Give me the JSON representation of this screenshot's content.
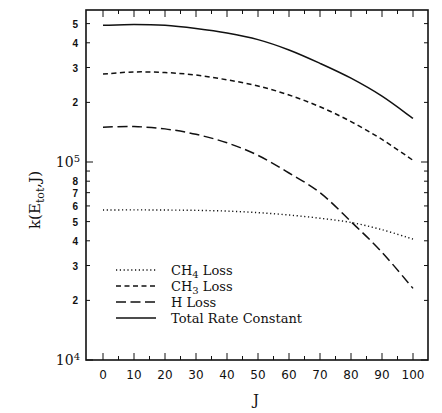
{
  "chart_data": {
    "type": "line",
    "title": "",
    "xlabel": "J",
    "ylabel": "k(E_tot,J)",
    "ylabel_display": {
      "main": "k(E",
      "sub": "tot",
      "tail": ",J)"
    },
    "yscale": "log",
    "xlim": [
      0,
      100
    ],
    "ylim": [
      10000,
      560000
    ],
    "x": [
      0,
      10,
      20,
      30,
      40,
      50,
      60,
      70,
      80,
      90,
      100
    ],
    "x_ticks": [
      "0",
      "10",
      "20",
      "30",
      "40",
      "50",
      "60",
      "70",
      "80",
      "90",
      "100"
    ],
    "y_ticks": [
      {
        "value": 10000,
        "label": "10",
        "sup": "4",
        "decade": true
      },
      {
        "value": 20000,
        "label": "2"
      },
      {
        "value": 30000,
        "label": "3"
      },
      {
        "value": 40000,
        "label": "4"
      },
      {
        "value": 50000,
        "label": "5"
      },
      {
        "value": 60000,
        "label": "6"
      },
      {
        "value": 70000,
        "label": "7"
      },
      {
        "value": 80000,
        "label": "8"
      },
      {
        "value": 100000,
        "label": "10",
        "sup": "5",
        "decade": true
      },
      {
        "value": 200000,
        "label": "2"
      },
      {
        "value": 300000,
        "label": "3"
      },
      {
        "value": 400000,
        "label": "4"
      },
      {
        "value": 500000,
        "label": "5"
      }
    ],
    "grid": false,
    "legend_position": "lower left",
    "series": [
      {
        "name": "CH4 Loss",
        "label_main": "CH",
        "label_sub": "4",
        "label_tail": " Loss",
        "style": "dotted",
        "values": [
          57200,
          57300,
          57200,
          57000,
          56500,
          55500,
          54000,
          52000,
          49500,
          45500,
          40800
        ]
      },
      {
        "name": "CH3 Loss",
        "label_main": "CH",
        "label_sub": "3",
        "label_tail": " Loss",
        "style": "short-dash",
        "values": [
          278000,
          285000,
          283000,
          275000,
          260000,
          242000,
          218000,
          190000,
          160000,
          130000,
          102000
        ]
      },
      {
        "name": "H Loss",
        "label_main": "H Loss",
        "label_sub": "",
        "label_tail": "",
        "style": "long-dash",
        "values": [
          150000,
          151000,
          147000,
          138000,
          125000,
          108000,
          88000,
          70000,
          50000,
          35000,
          23000
        ]
      },
      {
        "name": "Total Rate Constant",
        "label_main": "Total Rate Constant",
        "label_sub": "",
        "label_tail": "",
        "style": "solid",
        "values": [
          490000,
          495000,
          490000,
          472000,
          448000,
          415000,
          368000,
          315000,
          265000,
          215000,
          166000
        ]
      }
    ]
  }
}
